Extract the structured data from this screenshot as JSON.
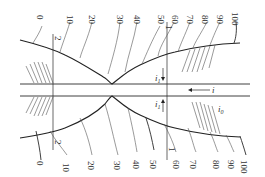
{
  "diagram": {
    "type": "grading-profile-symmetric",
    "top_scale": [
      "0",
      "10",
      "20",
      "30",
      "40",
      "50",
      "60",
      "70",
      "80",
      "90",
      "100"
    ],
    "bottom_scale": [
      "0",
      "10",
      "20",
      "30",
      "40",
      "50",
      "60",
      "70",
      "80",
      "90",
      "100"
    ],
    "section_labels": {
      "left": "2",
      "right": "1"
    },
    "symbols": {
      "i_main": "i",
      "i_one": "i",
      "i_one_sub": "1",
      "i_zero": "i",
      "i_zero_sub": "0"
    },
    "colors": {
      "line": "#2a2a2a",
      "text": "#333333",
      "background": "#ffffff"
    }
  }
}
